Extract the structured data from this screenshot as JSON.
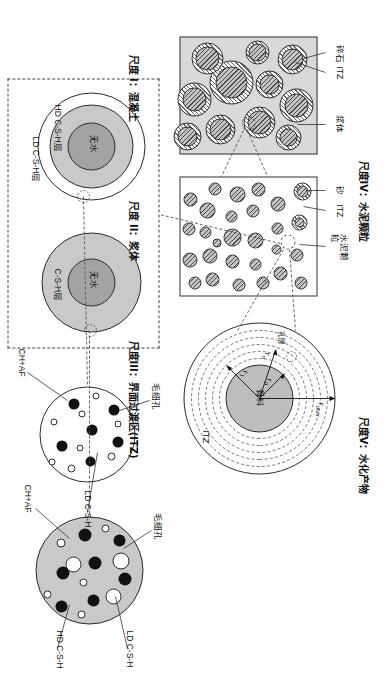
{
  "figure": {
    "kind": "multi-scale-cement-concrete-diagram",
    "orientation_deg": 90,
    "background": "#ffffff"
  },
  "scales": {
    "s1": {
      "title": "尺度 I：混凝土",
      "roman": "I",
      "name": "混凝土"
    },
    "s2": {
      "title": "尺度 II：浆体",
      "roman": "II",
      "name": "浆体"
    },
    "s3": {
      "title": "尺度III：界面过渡区(ITZ)",
      "roman": "III",
      "name": "界面过渡区(ITZ)"
    },
    "s4": {
      "title": "尺度IV：水泥颗粒",
      "roman": "IV",
      "name": "水泥颗粒"
    },
    "s5": {
      "title": "尺度V：水化产物",
      "roman": "V",
      "name": "水化产物"
    }
  },
  "scale1_labels": {
    "aggregate": "碎石",
    "itz": "ITZ",
    "paste": "浆体"
  },
  "scale2_labels": {
    "sand": "砂",
    "itz": "ITZ",
    "cement_particle": "水泥颗粒"
  },
  "scale3_labels": {
    "aggregate_core": "骨料",
    "itz_outer": "ITZ",
    "pore_note": "孔隙",
    "r0": "r",
    "r0_sub": "0",
    "r1": "r",
    "r1_sub": "1",
    "rmax": "r",
    "rmax_sub": "max",
    "rn": "r",
    "rn_sub": "n"
  },
  "scale4_labels": {
    "anhydrous": "无水",
    "csh_layer": "C-S-H层",
    "hd_csh_layer": "HD C-S-H层",
    "ld_csh_layer": "LD C-S-H层"
  },
  "scale5_labels": {
    "capillary_pore": "毛细孔",
    "ch_af": "CH+AF",
    "ld_csh": "LD C-S-H",
    "hd_csh": "HD C-S-H"
  },
  "colors": {
    "stroke": "#2b2b2b",
    "panel_grey": "#d9d9d9",
    "mid_grey": "#c9c9c9",
    "dark_grey": "#a3a3a3",
    "aggregate_grey": "#bdbdbd",
    "black": "#111111",
    "white": "#ffffff",
    "dash": "#444444"
  }
}
